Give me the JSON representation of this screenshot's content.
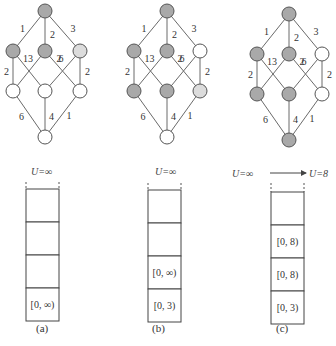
{
  "colors": {
    "visited": "#a9a9a9",
    "frontier": "#dcdcdc",
    "unvisited": "#ffffff"
  },
  "panels": [
    {
      "caption": "(a)",
      "node_states": [
        "visited",
        "visited",
        "visited",
        "frontier",
        "unvisited",
        "unvisited",
        "unvisited",
        "unvisited"
      ],
      "u_label": "U=∞",
      "u_label_new": "",
      "stack": [
        "",
        "",
        "",
        "[0, ∞)"
      ]
    },
    {
      "caption": "(b)",
      "node_states": [
        "visited",
        "visited",
        "visited",
        "unvisited",
        "visited",
        "visited",
        "frontier",
        "unvisited"
      ],
      "u_label": "U=∞",
      "u_label_new": "",
      "stack": [
        "",
        "",
        "[0, ∞)",
        "[0, 3)"
      ]
    },
    {
      "caption": "(c)",
      "node_states": [
        "visited",
        "visited",
        "visited",
        "unvisited",
        "visited",
        "visited",
        "unvisited",
        "visited"
      ],
      "u_label": "U=∞",
      "u_label_new": "U=8",
      "stack": [
        "",
        "[0, 8)",
        "[0, 8)",
        "[0, 3)"
      ]
    }
  ],
  "graph": {
    "edges": [
      {
        "from": 0,
        "to": 1,
        "w": "1"
      },
      {
        "from": 0,
        "to": 2,
        "w": "2"
      },
      {
        "from": 0,
        "to": 3,
        "w": "3"
      },
      {
        "from": 1,
        "to": 4,
        "w": "2"
      },
      {
        "from": 1,
        "to": 5,
        "w": "3"
      },
      {
        "from": 2,
        "to": 4,
        "w": "1"
      },
      {
        "from": 2,
        "to": 6,
        "w": "6"
      },
      {
        "from": 3,
        "to": 5,
        "w": "2"
      },
      {
        "from": 3,
        "to": 6,
        "w": "2"
      },
      {
        "from": 4,
        "to": 7,
        "w": "6"
      },
      {
        "from": 5,
        "to": 7,
        "w": "4"
      },
      {
        "from": 6,
        "to": 7,
        "w": "1"
      }
    ]
  }
}
